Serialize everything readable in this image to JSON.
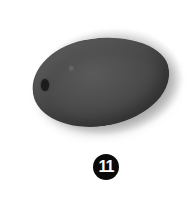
{
  "image": {
    "subject": "foam windscreen",
    "object_color": "#4a4a4a",
    "background_color": "#ffffff"
  },
  "badge": {
    "number": "11",
    "background_color": "#0a0a0a",
    "text_color": "#ffffff"
  }
}
